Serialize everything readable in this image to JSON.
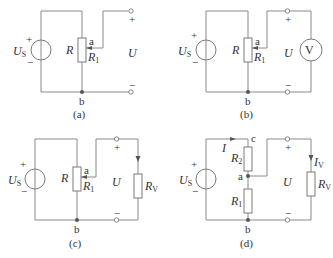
{
  "figure": {
    "panels": [
      {
        "id": "a",
        "caption": "(a)",
        "source_label": "U",
        "source_sub": "S",
        "resistor_label": "R",
        "tap_label": "a",
        "part_label": "R",
        "part_sub": "1",
        "output_label": "U",
        "node_label": "b",
        "plus": "+",
        "minus": "−"
      },
      {
        "id": "b",
        "caption": "(b)",
        "source_label": "U",
        "source_sub": "S",
        "resistor_label": "R",
        "tap_label": "a",
        "part_label": "R",
        "part_sub": "1",
        "output_label": "U",
        "meter_label": "V",
        "node_label": "b",
        "plus": "+",
        "minus": "−"
      },
      {
        "id": "c",
        "caption": "(c)",
        "source_label": "U",
        "source_sub": "S",
        "resistor_label": "R",
        "tap_label": "a",
        "part_label": "R",
        "part_sub": "1",
        "output_label": "U",
        "load_label": "R",
        "load_sub": "V",
        "node_label": "b",
        "plus": "+",
        "minus": "−"
      },
      {
        "id": "d",
        "caption": "(d)",
        "source_label": "U",
        "source_sub": "S",
        "current_label": "I",
        "node_c": "c",
        "r2_label": "R",
        "r2_sub": "2",
        "node_a": "a",
        "r1_label": "R",
        "r1_sub": "1",
        "output_label": "U",
        "load_current_label": "I",
        "load_current_sub": "V",
        "load_label": "R",
        "load_sub": "V",
        "node_label": "b",
        "plus": "+",
        "minus": "−"
      }
    ]
  }
}
